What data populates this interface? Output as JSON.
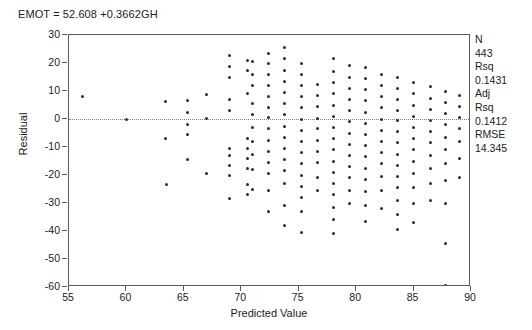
{
  "title": "EMOT = 52.608 +0.3662GH",
  "axes": {
    "x_title": "Predicted Value",
    "y_title": "Residual",
    "x_ticks": [
      "55",
      "60",
      "65",
      "70",
      "75",
      "80",
      "85",
      "90"
    ],
    "y_ticks": [
      "30",
      "20",
      "10",
      "0",
      "-10",
      "-20",
      "-30",
      "-40",
      "-50",
      "-60"
    ]
  },
  "stats": {
    "n_label": "N",
    "n_value": "443",
    "rsq_label": "Rsq",
    "rsq_value": "0.1431",
    "adj_label": "Adj",
    "adj_rsq_label": "Rsq",
    "adj_rsq_value": "0.1412",
    "rmse_label": "RMSE",
    "rmse_value": "14.345"
  },
  "chart_data": {
    "type": "scatter",
    "title": "EMOT = 52.608 +0.3662GH",
    "xlabel": "Predicted Value",
    "ylabel": "Residual",
    "xlim": [
      55,
      90
    ],
    "ylim": [
      -60,
      30
    ],
    "xticks": [
      55,
      60,
      65,
      70,
      75,
      80,
      85,
      90
    ],
    "yticks": [
      30,
      20,
      10,
      0,
      -10,
      -20,
      -30,
      -40,
      -50,
      -60
    ],
    "grid": false,
    "reference_line": {
      "type": "horizontal",
      "y": 0,
      "style": "dotted"
    },
    "marker": {
      "shape": "dot",
      "size": 3,
      "color": "#2b2b2b"
    },
    "annotations": [
      "N 443",
      "Rsq 0.1431",
      "Adj Rsq 0.1412",
      "RMSE 14.345"
    ],
    "legend": null,
    "n_points": 443,
    "points": [
      [
        56.2,
        8.0
      ],
      [
        60.0,
        0.0
      ],
      [
        63.4,
        6.2
      ],
      [
        63.4,
        -7.0
      ],
      [
        63.5,
        -23.5
      ],
      [
        65.3,
        6.6
      ],
      [
        65.3,
        2.3
      ],
      [
        65.3,
        -1.8
      ],
      [
        65.3,
        -5.4
      ],
      [
        65.3,
        -14.5
      ],
      [
        67.0,
        8.6
      ],
      [
        67.0,
        0.2
      ],
      [
        67.0,
        -19.5
      ],
      [
        69.0,
        22.6
      ],
      [
        69.0,
        18.8
      ],
      [
        69.0,
        15.0
      ],
      [
        69.0,
        6.8
      ],
      [
        69.0,
        3.0
      ],
      [
        69.0,
        -10.5
      ],
      [
        69.0,
        -13.0
      ],
      [
        69.0,
        -16.5
      ],
      [
        69.0,
        -20.0
      ],
      [
        69.0,
        -28.5
      ],
      [
        70.5,
        21.0
      ],
      [
        70.5,
        17.5
      ],
      [
        70.5,
        9.0
      ],
      [
        70.5,
        -6.8
      ],
      [
        70.5,
        -10.5
      ],
      [
        70.5,
        -14.0
      ],
      [
        70.5,
        -17.5
      ],
      [
        70.5,
        -23.5
      ],
      [
        70.5,
        -27.0
      ],
      [
        71.0,
        20.5
      ],
      [
        71.0,
        16.0
      ],
      [
        71.0,
        12.0
      ],
      [
        71.0,
        5.5
      ],
      [
        71.0,
        1.5
      ],
      [
        71.0,
        -3.0
      ],
      [
        71.0,
        -8.0
      ],
      [
        71.0,
        -12.5
      ],
      [
        71.0,
        -18.0
      ],
      [
        71.0,
        -25.0
      ],
      [
        72.4,
        23.5
      ],
      [
        72.4,
        19.8
      ],
      [
        72.4,
        16.0
      ],
      [
        72.4,
        12.0
      ],
      [
        72.4,
        8.0
      ],
      [
        72.4,
        4.0
      ],
      [
        72.4,
        0.5
      ],
      [
        72.4,
        -3.5
      ],
      [
        72.4,
        -7.5
      ],
      [
        72.4,
        -11.5
      ],
      [
        72.4,
        -15.5
      ],
      [
        72.4,
        -19.5
      ],
      [
        72.4,
        -25.5
      ],
      [
        72.4,
        -33.0
      ],
      [
        73.8,
        25.5
      ],
      [
        73.8,
        21.5
      ],
      [
        73.8,
        17.5
      ],
      [
        73.8,
        13.5
      ],
      [
        73.8,
        9.5
      ],
      [
        73.8,
        5.5
      ],
      [
        73.8,
        1.5
      ],
      [
        73.8,
        -2.5
      ],
      [
        73.8,
        -6.5
      ],
      [
        73.8,
        -10.5
      ],
      [
        73.8,
        -14.5
      ],
      [
        73.8,
        -18.5
      ],
      [
        73.8,
        -23.0
      ],
      [
        73.8,
        -31.0
      ],
      [
        73.8,
        -38.0
      ],
      [
        75.2,
        20.0
      ],
      [
        75.2,
        16.0
      ],
      [
        75.2,
        12.0
      ],
      [
        75.2,
        8.0
      ],
      [
        75.2,
        4.0
      ],
      [
        75.2,
        0.0
      ],
      [
        75.2,
        -4.0
      ],
      [
        75.2,
        -8.0
      ],
      [
        75.2,
        -12.0
      ],
      [
        75.2,
        -16.0
      ],
      [
        75.2,
        -20.0
      ],
      [
        75.2,
        -24.0
      ],
      [
        75.2,
        -28.0
      ],
      [
        75.2,
        -33.0
      ],
      [
        75.2,
        -40.5
      ],
      [
        76.6,
        12.5
      ],
      [
        76.6,
        8.5
      ],
      [
        76.6,
        4.5
      ],
      [
        76.6,
        0.3
      ],
      [
        76.6,
        -3.5
      ],
      [
        76.6,
        -7.5
      ],
      [
        76.6,
        -11.5
      ],
      [
        76.6,
        -15.5
      ],
      [
        76.6,
        -21.0
      ],
      [
        76.6,
        -25.5
      ],
      [
        78.0,
        21.5
      ],
      [
        78.0,
        17.0
      ],
      [
        78.0,
        13.0
      ],
      [
        78.0,
        9.0
      ],
      [
        78.0,
        5.0
      ],
      [
        78.0,
        1.0
      ],
      [
        78.0,
        -3.0
      ],
      [
        78.0,
        -7.0
      ],
      [
        78.0,
        -11.0
      ],
      [
        78.0,
        -15.0
      ],
      [
        78.0,
        -19.0
      ],
      [
        78.0,
        -23.0
      ],
      [
        78.0,
        -27.0
      ],
      [
        78.0,
        -31.5
      ],
      [
        78.0,
        -36.0
      ],
      [
        78.0,
        -41.0
      ],
      [
        79.4,
        19.0
      ],
      [
        79.4,
        15.0
      ],
      [
        79.4,
        11.0
      ],
      [
        79.4,
        7.0
      ],
      [
        79.4,
        3.0
      ],
      [
        79.4,
        -1.0
      ],
      [
        79.4,
        -5.0
      ],
      [
        79.4,
        -9.0
      ],
      [
        79.4,
        -13.0
      ],
      [
        79.4,
        -17.0
      ],
      [
        79.4,
        -21.0
      ],
      [
        79.4,
        -25.5
      ],
      [
        79.4,
        -30.0
      ],
      [
        80.8,
        18.5
      ],
      [
        80.8,
        14.5
      ],
      [
        80.8,
        10.5
      ],
      [
        80.8,
        6.5
      ],
      [
        80.8,
        2.5
      ],
      [
        80.8,
        -1.5
      ],
      [
        80.8,
        -5.5
      ],
      [
        80.8,
        -9.5
      ],
      [
        80.8,
        -13.5
      ],
      [
        80.8,
        -17.5
      ],
      [
        80.8,
        -21.5
      ],
      [
        80.8,
        -26.0
      ],
      [
        80.8,
        -31.0
      ],
      [
        80.8,
        -36.5
      ],
      [
        82.2,
        16.0
      ],
      [
        82.2,
        12.0
      ],
      [
        82.2,
        8.0
      ],
      [
        82.2,
        4.0
      ],
      [
        82.2,
        0.0
      ],
      [
        82.2,
        -4.0
      ],
      [
        82.2,
        -8.0
      ],
      [
        82.2,
        -12.0
      ],
      [
        82.2,
        -16.0
      ],
      [
        82.2,
        -20.5
      ],
      [
        82.2,
        -25.5
      ],
      [
        82.2,
        -32.0
      ],
      [
        83.6,
        15.0
      ],
      [
        83.6,
        11.0
      ],
      [
        83.6,
        7.0
      ],
      [
        83.6,
        3.0
      ],
      [
        83.6,
        -0.5
      ],
      [
        83.6,
        -4.5
      ],
      [
        83.6,
        -8.5
      ],
      [
        83.6,
        -12.5
      ],
      [
        83.6,
        -16.5
      ],
      [
        83.6,
        -20.5
      ],
      [
        83.6,
        -24.5
      ],
      [
        83.6,
        -29.0
      ],
      [
        83.6,
        -34.0
      ],
      [
        83.6,
        -39.5
      ],
      [
        85.0,
        13.0
      ],
      [
        85.0,
        9.0
      ],
      [
        85.0,
        5.0
      ],
      [
        85.0,
        1.0
      ],
      [
        85.0,
        -3.0
      ],
      [
        85.0,
        -7.0
      ],
      [
        85.0,
        -11.0
      ],
      [
        85.0,
        -15.0
      ],
      [
        85.0,
        -19.5
      ],
      [
        85.0,
        -24.5
      ],
      [
        85.0,
        -30.0
      ],
      [
        85.0,
        -37.0
      ],
      [
        86.5,
        11.5
      ],
      [
        86.5,
        7.5
      ],
      [
        86.5,
        3.5
      ],
      [
        86.5,
        -0.5
      ],
      [
        86.5,
        -4.5
      ],
      [
        86.5,
        -8.5
      ],
      [
        86.5,
        -13.0
      ],
      [
        86.5,
        -17.5
      ],
      [
        86.5,
        -23.0
      ],
      [
        86.5,
        -29.0
      ],
      [
        87.8,
        10.0
      ],
      [
        87.8,
        6.0
      ],
      [
        87.8,
        2.0
      ],
      [
        87.8,
        -2.0
      ],
      [
        87.8,
        -6.5
      ],
      [
        87.8,
        -11.0
      ],
      [
        87.8,
        -16.0
      ],
      [
        87.8,
        -22.0
      ],
      [
        87.8,
        -30.0
      ],
      [
        87.8,
        -44.5
      ],
      [
        87.8,
        -59.5
      ],
      [
        89.0,
        8.5
      ],
      [
        89.0,
        4.5
      ],
      [
        89.0,
        0.5
      ],
      [
        89.0,
        -3.5
      ],
      [
        89.0,
        -8.0
      ],
      [
        89.0,
        -14.0
      ],
      [
        89.0,
        -21.0
      ]
    ]
  }
}
